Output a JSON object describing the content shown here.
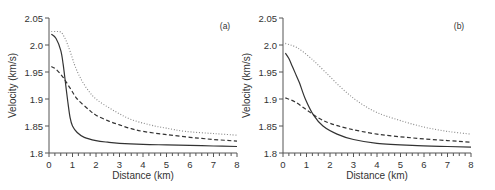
{
  "chart_data": [
    {
      "type": "line",
      "panel_label": "(a)",
      "title": "",
      "xlabel": "Distance (km)",
      "ylabel": "Velocity (km/s)",
      "xlim": [
        0,
        8
      ],
      "ylim": [
        1.8,
        2.05
      ],
      "x_ticks": [
        "0",
        "1",
        "2",
        "3",
        "4",
        "5",
        "6",
        "7",
        "8"
      ],
      "y_ticks": [
        "1.8",
        "1.85",
        "1.9",
        "1.95",
        "2.0",
        "2.05"
      ],
      "grid": false,
      "series": [
        {
          "name": "solid",
          "style": "solid",
          "color": "#333333",
          "x": [
            0.1,
            0.3,
            0.5,
            0.6,
            0.7,
            0.8,
            0.9,
            1.0,
            1.2,
            1.5,
            2.0,
            2.5,
            3.0,
            4.0,
            5.0,
            6.0,
            7.0,
            8.0
          ],
          "y": [
            2.02,
            2.012,
            1.99,
            1.965,
            1.93,
            1.895,
            1.865,
            1.85,
            1.838,
            1.829,
            1.823,
            1.82,
            1.818,
            1.816,
            1.815,
            1.814,
            1.813,
            1.812
          ]
        },
        {
          "name": "dashed",
          "style": "dashed",
          "color": "#333333",
          "x": [
            0.1,
            0.3,
            0.6,
            0.9,
            1.2,
            1.7,
            2.0,
            2.5,
            3.0,
            3.5,
            4.0,
            5.0,
            6.0,
            6.5,
            7.0,
            8.0
          ],
          "y": [
            1.96,
            1.955,
            1.94,
            1.92,
            1.9,
            1.88,
            1.87,
            1.86,
            1.852,
            1.845,
            1.84,
            1.834,
            1.829,
            1.827,
            1.825,
            1.822
          ]
        },
        {
          "name": "dotted",
          "style": "dotted",
          "color": "#888888",
          "x": [
            0.1,
            0.3,
            0.5,
            0.65,
            0.8,
            1.0,
            1.1,
            1.3,
            1.6,
            2.0,
            2.7,
            3.5,
            4.5,
            5.0,
            5.8,
            7.0,
            8.0
          ],
          "y": [
            2.025,
            2.025,
            2.024,
            2.015,
            2.0,
            1.975,
            1.962,
            1.942,
            1.92,
            1.9,
            1.88,
            1.862,
            1.85,
            1.846,
            1.84,
            1.836,
            1.833
          ]
        }
      ]
    },
    {
      "type": "line",
      "panel_label": "(b)",
      "title": "",
      "xlabel": "Distance (km)",
      "ylabel": "Velocity (km/s)",
      "xlim": [
        0,
        8
      ],
      "ylim": [
        1.8,
        2.05
      ],
      "x_ticks": [
        "0",
        "1",
        "2",
        "3",
        "4",
        "5",
        "6",
        "7",
        "8"
      ],
      "y_ticks": [
        "1.8",
        "1.85",
        "1.9",
        "1.95",
        "2.0",
        "2.05"
      ],
      "grid": false,
      "series": [
        {
          "name": "solid",
          "style": "solid",
          "color": "#333333",
          "x": [
            0.1,
            0.25,
            0.4,
            0.55,
            0.7,
            0.95,
            1.3,
            1.7,
            2.3,
            3.0,
            4.0,
            5.5,
            7.0,
            8.0
          ],
          "y": [
            1.985,
            1.975,
            1.96,
            1.945,
            1.93,
            1.9,
            1.87,
            1.85,
            1.835,
            1.825,
            1.818,
            1.814,
            1.812,
            1.811
          ]
        },
        {
          "name": "dashed",
          "style": "dashed",
          "color": "#333333",
          "x": [
            0.1,
            0.5,
            1.0,
            1.5,
            2.0,
            2.8,
            4.0,
            5.5,
            7.0,
            8.0
          ],
          "y": [
            1.902,
            1.895,
            1.88,
            1.865,
            1.855,
            1.845,
            1.835,
            1.828,
            1.823,
            1.82
          ]
        },
        {
          "name": "dotted",
          "style": "dotted",
          "color": "#888888",
          "x": [
            0.1,
            0.6,
            1.2,
            1.8,
            2.5,
            3.2,
            4.0,
            5.0,
            6.0,
            7.0,
            8.0
          ],
          "y": [
            2.003,
            1.995,
            1.975,
            1.95,
            1.92,
            1.895,
            1.875,
            1.86,
            1.848,
            1.84,
            1.835
          ]
        }
      ]
    }
  ]
}
